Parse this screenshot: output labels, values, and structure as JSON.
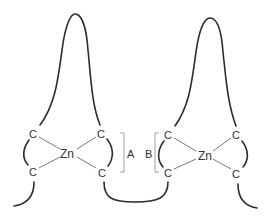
{
  "diagram": {
    "type": "zinc-finger-motif",
    "fingers": [
      {
        "id": "left",
        "metal": "Zn",
        "ligands": [
          "C",
          "C",
          "C",
          "C"
        ],
        "bracket_label": "A"
      },
      {
        "id": "right",
        "metal": "Zn",
        "ligands": [
          "C",
          "C",
          "C",
          "C"
        ],
        "bracket_label": "B"
      }
    ],
    "colors": {
      "line": "#2b2b2b",
      "bond": "#555555",
      "bracket": "#888888",
      "background": "#ffffff"
    }
  }
}
